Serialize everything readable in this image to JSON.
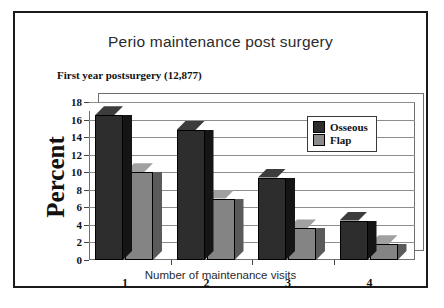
{
  "chart_data": {
    "type": "bar",
    "title": "Perio maintenance post surgery",
    "subtitle": "First year postsurgery (12,877)",
    "xlabel": "Number of maintenance visits",
    "ylabel": "Percent",
    "categories": [
      "1",
      "2",
      "3",
      "4"
    ],
    "yticks": [
      "0",
      "2",
      "4",
      "6",
      "8",
      "10",
      "12",
      "14",
      "16",
      "18"
    ],
    "ylim": [
      0,
      18
    ],
    "grid": true,
    "legend_position": "top-right",
    "series": [
      {
        "name": "Osseous",
        "color": "#2d2d2d",
        "values": [
          16.5,
          14.8,
          9.4,
          4.5
        ]
      },
      {
        "name": "Flap",
        "color": "#848484",
        "values": [
          10.0,
          7.0,
          3.6,
          1.8
        ]
      }
    ]
  }
}
